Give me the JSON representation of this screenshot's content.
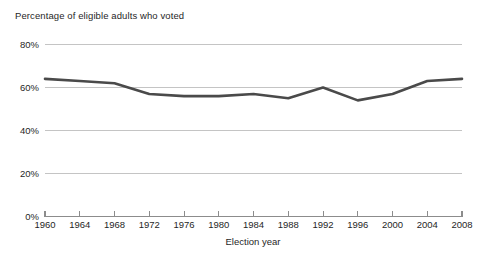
{
  "chart_data": {
    "type": "line",
    "title": "Percentage of eligible adults who voted",
    "xlabel": "Election year",
    "ylabel": "",
    "categories": [
      1960,
      1964,
      1968,
      1972,
      1976,
      1980,
      1984,
      1988,
      1992,
      1996,
      2000,
      2004,
      2008
    ],
    "values": [
      64,
      63,
      62,
      57,
      56,
      56,
      57,
      55,
      60,
      54,
      57,
      63,
      64
    ],
    "series": [
      {
        "name": "Percentage of eligible adults who voted",
        "values": [
          64,
          63,
          62,
          57,
          56,
          56,
          57,
          55,
          60,
          54,
          57,
          63,
          64
        ]
      }
    ],
    "x_tick_labels": [
      "1960",
      "1964",
      "1968",
      "1972",
      "1976",
      "1980",
      "1984",
      "1988",
      "1992",
      "1996",
      "2000",
      "2004",
      "2008"
    ],
    "y_tick_labels": [
      "0%",
      "20%",
      "40%",
      "60%",
      "80%"
    ],
    "y_tick_values": [
      0,
      20,
      40,
      60,
      80
    ],
    "ylim": [
      0,
      80
    ],
    "xlim": [
      1960,
      2008
    ],
    "grid": true,
    "legend": false,
    "line_color": "#4a4a4a",
    "grid_color": "#b5b5b5",
    "axis_color": "#8c8c8c",
    "background_color": "#ffffff"
  }
}
